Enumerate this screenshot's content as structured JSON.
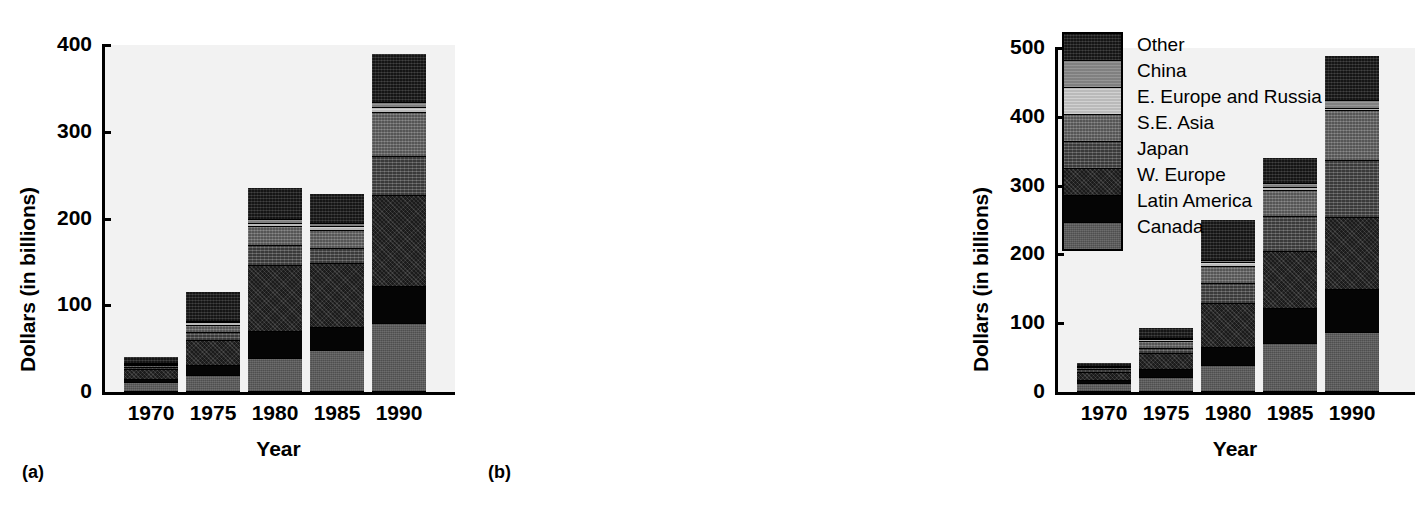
{
  "figure": {
    "panel_a_label": "(a)",
    "panel_b_label": "(b)"
  },
  "legend": {
    "entries": [
      {
        "label": "Other",
        "fill": "f-other",
        "color": "#1b1b1b"
      },
      {
        "label": "China",
        "fill": "f-china",
        "color": "#8a8a8a"
      },
      {
        "label": "E. Europe and Russia",
        "fill": "f-eeurope",
        "color": "#c4c4c4"
      },
      {
        "label": "S.E. Asia",
        "fill": "f-seasia",
        "color": "#6b6b6b"
      },
      {
        "label": "Japan",
        "fill": "f-japan",
        "color": "#4e4e4e"
      },
      {
        "label": "W. Europe",
        "fill": "f-weurope",
        "color": "#232323"
      },
      {
        "label": "Latin America",
        "fill": "f-latin",
        "color": "#050505"
      },
      {
        "label": "Canada",
        "fill": "f-canada",
        "color": "#5a5a5a"
      }
    ]
  },
  "chart_data": [
    {
      "id": "a",
      "type": "bar",
      "stacked": true,
      "title": "",
      "xlabel": "Year",
      "ylabel": "Dollars (in billions)",
      "categories": [
        "1970",
        "1975",
        "1980",
        "1985",
        "1990"
      ],
      "yticks": [
        0,
        100,
        200,
        300,
        400
      ],
      "ylim": [
        0,
        400
      ],
      "grid": false,
      "legend_position": "right-outside",
      "series": [
        {
          "name": "Canada",
          "values": [
            10,
            19,
            38,
            47,
            78
          ]
        },
        {
          "name": "Latin America",
          "values": [
            4,
            11,
            31,
            27,
            43
          ]
        },
        {
          "name": "W. Europe",
          "values": [
            11,
            29,
            76,
            74,
            105
          ]
        },
        {
          "name": "Japan",
          "values": [
            3,
            9,
            23,
            17,
            45
          ]
        },
        {
          "name": "S.E. Asia",
          "values": [
            2,
            8,
            22,
            21,
            51
          ]
        },
        {
          "name": "E. Europe and Russia",
          "values": [
            1,
            3,
            4,
            4,
            5
          ]
        },
        {
          "name": "China",
          "values": [
            1,
            2,
            4,
            4,
            6
          ]
        },
        {
          "name": "Other",
          "values": [
            8,
            34,
            37,
            34,
            57
          ]
        }
      ],
      "totals": [
        40,
        115,
        235,
        228,
        390
      ]
    },
    {
      "id": "b",
      "type": "bar",
      "stacked": true,
      "title": "",
      "xlabel": "Year",
      "ylabel": "Dollars (in billions)",
      "categories": [
        "1970",
        "1975",
        "1980",
        "1985",
        "1990"
      ],
      "yticks": [
        0,
        100,
        200,
        300,
        400,
        500
      ],
      "ylim": [
        0,
        500
      ],
      "grid": false,
      "legend_position": "right-outside",
      "series": [
        {
          "name": "Canada",
          "values": [
            11,
            21,
            38,
            70,
            86
          ]
        },
        {
          "name": "Latin America",
          "values": [
            5,
            11,
            26,
            50,
            62
          ]
        },
        {
          "name": "W. Europe",
          "values": [
            12,
            23,
            64,
            84,
            105
          ]
        },
        {
          "name": "Japan",
          "values": [
            4,
            8,
            29,
            50,
            83
          ]
        },
        {
          "name": "S.E. Asia",
          "values": [
            3,
            9,
            25,
            38,
            72
          ]
        },
        {
          "name": "E. Europe and Russia",
          "values": [
            1,
            3,
            5,
            5,
            4
          ]
        },
        {
          "name": "China",
          "values": [
            1,
            2,
            4,
            5,
            11
          ]
        },
        {
          "name": "Other",
          "values": [
            5,
            16,
            59,
            38,
            65
          ]
        }
      ],
      "totals": [
        42,
        93,
        250,
        340,
        488
      ]
    }
  ]
}
